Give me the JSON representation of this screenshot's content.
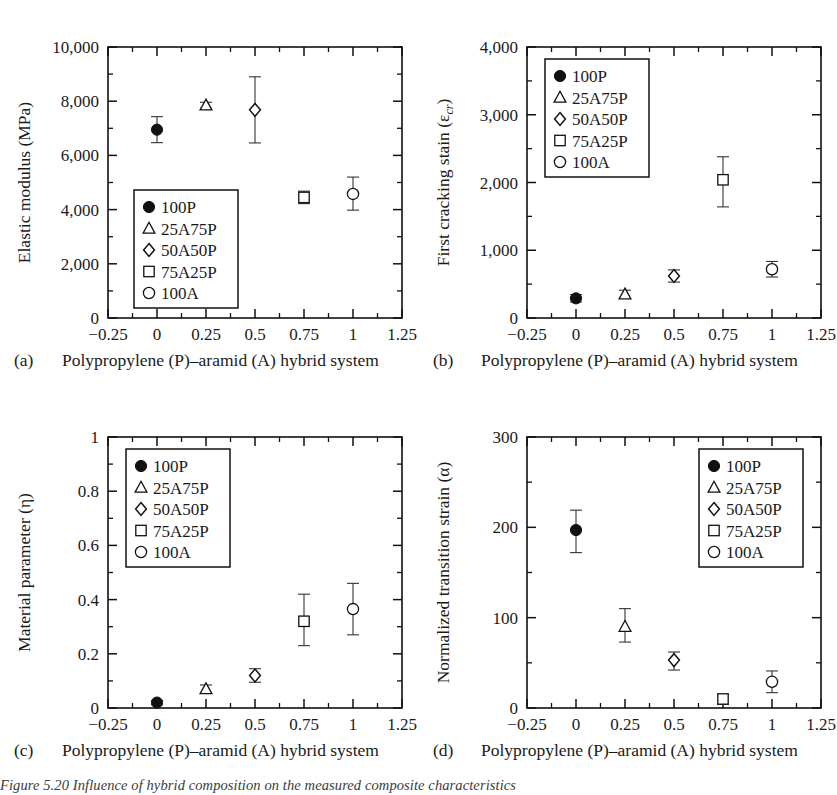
{
  "figure": {
    "caption": "Figure 5.20 Influence of hybrid composition on the measured composite characteristics",
    "series_names": [
      "100P",
      "25A75P",
      "50A50P",
      "75A25P",
      "100A"
    ],
    "markers": [
      "filled-circle",
      "open-triangle",
      "open-diamond",
      "open-square",
      "open-circle"
    ],
    "x_axis": {
      "label": "Polypropylene (P)–aramid (A) hybrid system",
      "ticks": [
        "−0.25",
        "0",
        "0.25",
        "0.5",
        "0.75",
        "1",
        "1.25"
      ],
      "tick_values": [
        -0.25,
        0,
        0.25,
        0.5,
        0.75,
        1,
        1.25
      ],
      "min": -0.25,
      "max": 1.25,
      "minor_ticks": true
    }
  },
  "chart_data": [
    {
      "type": "scatter",
      "panel": "(a)",
      "title": "",
      "xlabel": "Polypropylene (P)–aramid (A) hybrid system",
      "ylabel": "Elastic modulus (MPa)",
      "xlim": [
        -0.25,
        1.25
      ],
      "ylim": [
        0,
        10000
      ],
      "yticks": [
        0,
        2000,
        4000,
        6000,
        8000,
        10000
      ],
      "ytick_labels": [
        "0",
        "2,000",
        "4,000",
        "6,000",
        "8,000",
        "10,000"
      ],
      "legend_position": "lower-left",
      "grid": false,
      "x": [
        0,
        0.25,
        0.5,
        0.75,
        1
      ],
      "values": [
        6950,
        7850,
        7680,
        4450,
        4580
      ],
      "err_low": [
        480,
        110,
        1220,
        230,
        600
      ],
      "err_high": [
        480,
        110,
        1220,
        230,
        620
      ],
      "series_labels": [
        "100P",
        "25A75P",
        "50A50P",
        "75A25P",
        "100A"
      ]
    },
    {
      "type": "scatter",
      "panel": "(b)",
      "title": "",
      "xlabel": "Polypropylene (P)–aramid (A) hybrid system",
      "ylabel": "First cracking stain (εcr)",
      "ylabel_main": "First cracking stain (ε",
      "ylabel_sub": "cr",
      "ylabel_tail": ")",
      "xlim": [
        -0.25,
        1.25
      ],
      "ylim": [
        0,
        4000
      ],
      "yticks": [
        0,
        1000,
        2000,
        3000,
        4000
      ],
      "ytick_labels": [
        "0",
        "1,000",
        "2,000",
        "3,000",
        "4,000"
      ],
      "legend_position": "upper-left",
      "grid": false,
      "x": [
        0,
        0.25,
        0.5,
        0.75,
        1
      ],
      "values": [
        290,
        350,
        620,
        2040,
        720
      ],
      "err_low": [
        55,
        60,
        90,
        400,
        115
      ],
      "err_high": [
        55,
        60,
        90,
        340,
        115
      ],
      "series_labels": [
        "100P",
        "25A75P",
        "50A50P",
        "75A25P",
        "100A"
      ]
    },
    {
      "type": "scatter",
      "panel": "(c)",
      "title": "",
      "xlabel": "Polypropylene (P)–aramid (A) hybrid system",
      "ylabel": "Material parameter (η)",
      "xlim": [
        -0.25,
        1.25
      ],
      "ylim": [
        0,
        1
      ],
      "yticks": [
        0,
        0.2,
        0.4,
        0.6,
        0.8,
        1
      ],
      "ytick_labels": [
        "0",
        "0.2",
        "0.4",
        "0.6",
        "0.8",
        "1"
      ],
      "legend_position": "upper-left",
      "grid": false,
      "x": [
        0,
        0.25,
        0.5,
        0.75,
        1
      ],
      "values": [
        0.02,
        0.07,
        0.12,
        0.32,
        0.365
      ],
      "err_low": [
        0.008,
        0.015,
        0.025,
        0.09,
        0.095
      ],
      "err_high": [
        0.008,
        0.015,
        0.025,
        0.1,
        0.095
      ],
      "series_labels": [
        "100P",
        "25A75P",
        "50A50P",
        "75A25P",
        "100A"
      ]
    },
    {
      "type": "scatter",
      "panel": "(d)",
      "title": "",
      "xlabel": "Polypropylene (P)–aramid (A) hybrid system",
      "ylabel": "Normalized transition strain (α)",
      "xlim": [
        -0.25,
        1.25
      ],
      "ylim": [
        0,
        300
      ],
      "yticks": [
        0,
        100,
        200,
        300
      ],
      "ytick_labels": [
        "0",
        "100",
        "200",
        "300"
      ],
      "legend_position": "upper-right",
      "grid": false,
      "x": [
        0,
        0.25,
        0.5,
        0.75,
        1
      ],
      "values": [
        197,
        90,
        53,
        10,
        29
      ],
      "err_low": [
        25,
        17,
        11,
        6,
        12
      ],
      "err_high": [
        22,
        20,
        9,
        5,
        12
      ],
      "series_labels": [
        "100P",
        "25A75P",
        "50A50P",
        "75A25P",
        "100A"
      ]
    }
  ]
}
